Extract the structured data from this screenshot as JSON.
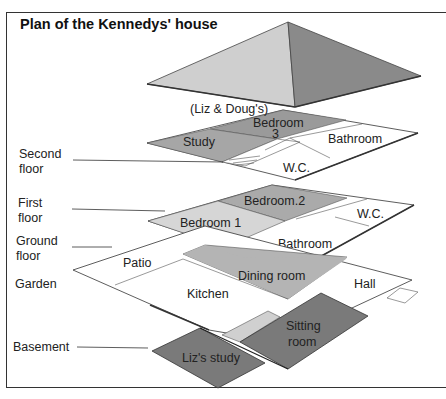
{
  "title": "Plan of the Kennedys' house",
  "floor_labels": {
    "second": [
      "Second",
      "floor"
    ],
    "first": [
      "First",
      "floor"
    ],
    "ground": [
      "Ground",
      "floor"
    ],
    "garden": "Garden",
    "basement": "Basement"
  },
  "rooms": {
    "second_floor": {
      "owner_note": "(Liz & Doug's)",
      "bedroom3": [
        "Bedroom",
        "3"
      ],
      "study": "Study",
      "bathroom": "Bathroom",
      "wc": "W.C."
    },
    "first_floor": {
      "bedroom2": "Bedroom.2",
      "bedroom1": "Bedroom 1",
      "wc": "W.C.",
      "bathroom": "Bathroom"
    },
    "ground_floor": {
      "patio": "Patio",
      "dining_room": "Dining room",
      "kitchen": "Kitchen",
      "hall": "Hall"
    },
    "basement": {
      "sitting_room": [
        "Sitting",
        "room"
      ],
      "liz_study": "Liz's study"
    }
  },
  "colors": {
    "roof_left": "#cfcfcf",
    "roof_right": "#8a8a8a",
    "dark_room": "#7a7a7a",
    "mid_room": "#b4b4b4",
    "light_room": "#d6d6d6",
    "white_room": "#ffffff",
    "line": "#333333"
  }
}
